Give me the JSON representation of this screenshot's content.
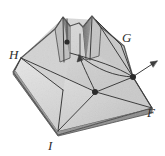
{
  "figure": {
    "kind": "line-engraving",
    "background_color": "#ffffff",
    "paper_fill_color": "#d9d9d9",
    "paper_fill_light": "#e4e4e4",
    "paper_fill_shadow": "#b9b9b9",
    "paper_fill_dark": "#8e8e8e",
    "edge_color": "#4a4a4a",
    "line_color": "#3a3a3a",
    "node_color": "#2b2b2b",
    "label_color": "#2e2e2e"
  },
  "labels": [
    {
      "id": "H",
      "text": "H",
      "x": 9,
      "y": 48,
      "name": "vertex-label-h"
    },
    {
      "id": "G",
      "text": "G",
      "x": 122,
      "y": 31,
      "name": "vertex-label-g"
    },
    {
      "id": "F",
      "text": "F",
      "x": 147,
      "y": 106,
      "name": "vertex-label-f"
    },
    {
      "id": "I",
      "text": "I",
      "x": 48,
      "y": 139,
      "name": "vertex-label-i"
    }
  ],
  "nodes": [
    {
      "id": "node-top",
      "x": 67,
      "y": 42,
      "r": 2.6,
      "name": "fold-node-top"
    },
    {
      "id": "node-mid",
      "x": 95,
      "y": 92,
      "r": 3.0,
      "name": "fold-node-center"
    },
    {
      "id": "node-right",
      "x": 133,
      "y": 77,
      "r": 3.0,
      "name": "fold-node-right"
    }
  ],
  "arrows": [
    {
      "id": "arrow-right",
      "from_x": 133,
      "from_y": 77,
      "to_x": 157,
      "to_y": 62,
      "name": "direction-arrow-right"
    },
    {
      "id": "arrow-inner",
      "from_x": 95,
      "from_y": 92,
      "to_x": 78,
      "to_y": 53,
      "name": "direction-arrow-inner"
    }
  ],
  "polygons": {
    "front_left_face": "M 21,60 L 63,112 L 58,131 L 15,70 Z",
    "base_front_face": "M 15,70 L 58,131 L 152,108 L 96,92 Z",
    "right_lower_face": "M 96,92 L 58,131 L 152,108 Z",
    "top_left_panel": "M 21,58 L 63,18 L 78,52 L 63,90 Z",
    "top_right_panel": "M 78,52 L 96,20 L 133,77 L 96,92 Z",
    "upper_ridge": "M 21,58 L 63,18 L 96,20 L 124,46 L 133,77 L 96,92 L 63,90 Z",
    "left_peak_front": "M 55,28 L 63,18 L 72,26 L 70,58 L 62,64 Z",
    "left_peak_inner": "M 63,18 L 72,26 L 70,58 L 64,26 Z",
    "right_peak_front": "M 84,26 L 92,17 L 101,27 L 99,56 L 86,60 Z",
    "right_peak_inner": "M 92,17 L 101,27 L 99,56 L 93,27 Z",
    "bottom_edge_band": "M 15,70 L 58,131 L 152,108 L 152,112 L 58,136 L 13,74 Z"
  },
  "fold_lines": [
    {
      "id": "ridge-h-to-mid",
      "d": "M 21,59 L 96,92"
    },
    {
      "id": "ridge-mid-to-f",
      "d": "M 96,92 L 152,108"
    },
    {
      "id": "ridge-mid-to-i",
      "d": "M 96,92 L 58,131"
    },
    {
      "id": "ridge-mid-right",
      "d": "M 96,92 L 133,77"
    },
    {
      "id": "ridge-right-to-f",
      "d": "M 133,77 L 152,108"
    },
    {
      "id": "ridge-right-to-g",
      "d": "M 133,77 L 121,44"
    },
    {
      "id": "ridge-g-to-peak",
      "d": "M 121,44 L 96,20"
    },
    {
      "id": "arc-mid-right",
      "d": "M 72,55 C 96,62 118,68 133,77"
    },
    {
      "id": "arc-inner-curve",
      "d": "M 79,53 C 96,68 112,76 133,77"
    },
    {
      "id": "crease-left",
      "d": "M 21,58 L 63,90"
    },
    {
      "id": "crease-left-peak",
      "d": "M 63,18 L 63,90"
    },
    {
      "id": "crease-right-peak",
      "d": "M 92,18 L 96,92"
    },
    {
      "id": "crease-to-g",
      "d": "M 96,20 L 133,77"
    },
    {
      "id": "node-stem",
      "d": "M 67,42 L 67,18"
    }
  ],
  "outline": "M 21,58 L 55,28 L 63,18 L 72,26 L 79,22 L 84,26 L 92,17 L 101,27 L 124,46 L 133,77 L 152,108 L 58,135 L 13,72 Z"
}
